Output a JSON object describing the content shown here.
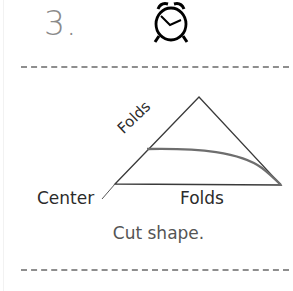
{
  "step": {
    "number": "3.",
    "icon": "alarm-clock-icon"
  },
  "diagram": {
    "labels": {
      "folds_diagonal": "Folds",
      "center": "Center",
      "folds_bottom": "Folds"
    },
    "caption": "Cut shape.",
    "colors": {
      "outline": "#3a3a3a",
      "cut_line": "#6e6e6e",
      "dashes": "#8e8e8e"
    }
  }
}
